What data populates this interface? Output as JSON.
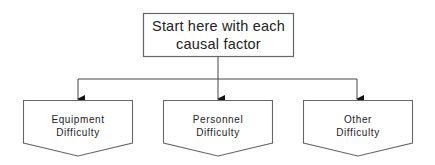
{
  "diagram": {
    "type": "flowchart",
    "root": {
      "lines": [
        "Start here with each",
        "causal factor"
      ]
    },
    "children": [
      {
        "id": "equipment",
        "lines": [
          "Equipment",
          "Difficulty"
        ]
      },
      {
        "id": "personnel",
        "lines": [
          "Personnel",
          "Difficulty"
        ]
      },
      {
        "id": "other",
        "lines": [
          "Other",
          "Difficulty"
        ]
      }
    ],
    "colors": {
      "stroke": "#555555",
      "text": "#222222",
      "background": "#ffffff"
    }
  }
}
